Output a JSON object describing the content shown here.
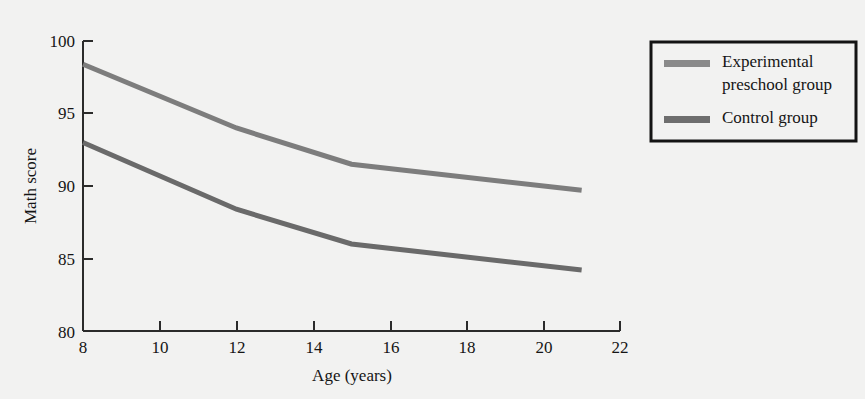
{
  "chart_data": {
    "type": "line",
    "title": "",
    "xlabel": "Age (years)",
    "ylabel": "Math score",
    "xlim": [
      8,
      22
    ],
    "ylim": [
      80,
      100
    ],
    "xticks": [
      8,
      10,
      12,
      14,
      16,
      18,
      20,
      22
    ],
    "yticks": [
      80,
      85,
      90,
      95,
      100
    ],
    "grid": false,
    "legend_position": "right-top",
    "x": [
      8,
      12,
      15,
      21
    ],
    "series": [
      {
        "name": "Experimental preschool group",
        "values": [
          98.4,
          94.0,
          91.5,
          89.7
        ],
        "color": "#7d7d7d"
      },
      {
        "name": "Control group",
        "values": [
          93.0,
          88.4,
          86.0,
          84.2
        ],
        "color": "#6a6a6a"
      }
    ]
  },
  "axes": {
    "y_label": "Math score",
    "x_label": "Age (years)",
    "y_tick_labels": [
      "100",
      "95",
      "90",
      "85",
      "80"
    ],
    "x_tick_labels": [
      "8",
      "10",
      "12",
      "14",
      "16",
      "18",
      "20",
      "22"
    ]
  },
  "legend": {
    "entries": [
      {
        "label_line1": "Experimental",
        "label_line2": "preschool group",
        "swatch_color": "#8a8a8a"
      },
      {
        "label_line1": "Control group",
        "label_line2": "",
        "swatch_color": "#6e6e6e"
      }
    ]
  },
  "colors": {
    "background": "#f2f2f1",
    "axis": "#2b2b2b",
    "text": "#151515",
    "experimental": "#7d7d7d",
    "control": "#6a6a6a"
  }
}
